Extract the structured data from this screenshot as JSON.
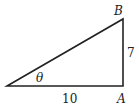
{
  "diagram": {
    "type": "right-triangle",
    "vertices": {
      "B": "B",
      "A": "A"
    },
    "angle_label": "θ",
    "side_labels": {
      "opposite": "7",
      "adjacent": "10"
    },
    "colors": {
      "stroke": "#222222",
      "background": "#ffffff"
    }
  }
}
